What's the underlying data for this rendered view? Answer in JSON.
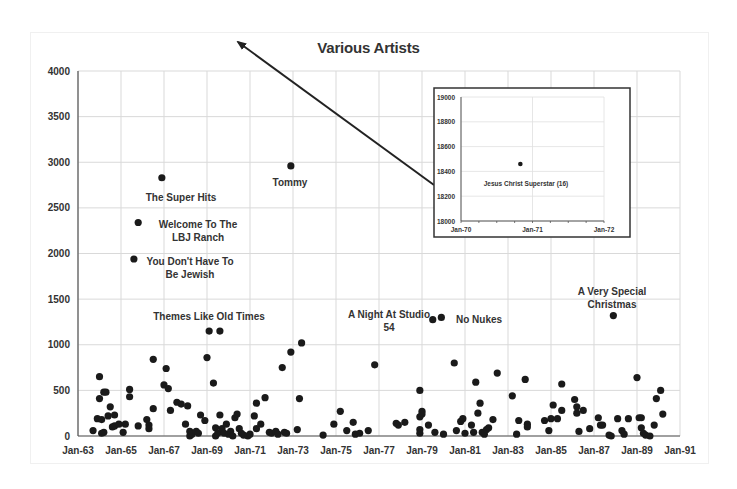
{
  "chart_data": {
    "type": "scatter",
    "title": "Various Artists",
    "xlabel": "",
    "ylabel": "",
    "ylim": [
      0,
      4000
    ],
    "yticks": [
      "0",
      "500",
      "1000",
      "1500",
      "2000",
      "2500",
      "3000",
      "3500",
      "4000"
    ],
    "xticks": [
      "Jan-63",
      "Jan-65",
      "Jan-67",
      "Jan-69",
      "Jan-71",
      "Jan-73",
      "Jan-75",
      "Jan-77",
      "Jan-79",
      "Jan-81",
      "Jan-83",
      "Jan-85",
      "Jan-87",
      "Jan-89",
      "Jan-91"
    ],
    "xlim_years": [
      1963,
      1991
    ],
    "grid": true,
    "legend": null,
    "annotations": [
      {
        "text": "The Super Hits",
        "lines": [
          "The Super Hits"
        ],
        "point": [
          1966.9,
          2830
        ]
      },
      {
        "text": "Welcome To The LBJ Ranch",
        "lines": [
          "Welcome To The",
          "LBJ Ranch"
        ],
        "point": [
          1965.8,
          2340
        ]
      },
      {
        "text": "You Don't Have To Be Jewish",
        "lines": [
          "You Don't Have To",
          "Be Jewish"
        ],
        "point": [
          1965.6,
          1940
        ]
      },
      {
        "text": "Tommy",
        "lines": [
          "Tommy"
        ],
        "point": [
          1972.9,
          2960
        ]
      },
      {
        "text": "Themes Like Old Times",
        "lines": [
          "Themes Like Old Times"
        ],
        "point": [
          1969.1,
          1150
        ]
      },
      {
        "text": "A Night At Studio 54",
        "lines": [
          "A Night At Studio",
          "54"
        ],
        "point": [
          1979.5,
          1275
        ]
      },
      {
        "text": "No Nukes",
        "lines": [
          "No Nukes"
        ],
        "point": [
          1979.9,
          1300
        ]
      },
      {
        "text": "A Very Special Christmas",
        "lines": [
          "A Very Special",
          "Christmas"
        ],
        "point": [
          1987.9,
          1320
        ]
      }
    ],
    "inset": {
      "ylim": [
        18000,
        19000
      ],
      "yticks": [
        "18000",
        "18200",
        "18400",
        "18600",
        "18800",
        "19000"
      ],
      "xticks": [
        "Jan-70",
        "Jan-71",
        "Jan-72"
      ],
      "points": [
        {
          "x": 1970.83,
          "y": 18460,
          "label": "Jesus Christ Superstar (16)"
        }
      ]
    },
    "points": [
      [
        1963.7,
        60
      ],
      [
        1963.9,
        190
      ],
      [
        1964.0,
        650
      ],
      [
        1964.0,
        410
      ],
      [
        1964.1,
        180
      ],
      [
        1964.1,
        30
      ],
      [
        1964.2,
        480
      ],
      [
        1964.3,
        480
      ],
      [
        1964.2,
        40
      ],
      [
        1964.4,
        220
      ],
      [
        1964.5,
        320
      ],
      [
        1964.6,
        100
      ],
      [
        1964.7,
        230
      ],
      [
        1964.7,
        110
      ],
      [
        1964.9,
        130
      ],
      [
        1965.1,
        40
      ],
      [
        1965.2,
        130
      ],
      [
        1965.4,
        510
      ],
      [
        1965.4,
        430
      ],
      [
        1965.8,
        110
      ],
      [
        1966.2,
        180
      ],
      [
        1966.3,
        120
      ],
      [
        1966.3,
        80
      ],
      [
        1966.5,
        300
      ],
      [
        1966.5,
        840
      ],
      [
        1967.0,
        560
      ],
      [
        1967.1,
        740
      ],
      [
        1967.2,
        520
      ],
      [
        1967.3,
        280
      ],
      [
        1967.6,
        370
      ],
      [
        1967.8,
        350
      ],
      [
        1968.0,
        130
      ],
      [
        1968.1,
        330
      ],
      [
        1968.2,
        50
      ],
      [
        1968.2,
        0
      ],
      [
        1968.3,
        20
      ],
      [
        1968.5,
        50
      ],
      [
        1968.6,
        30
      ],
      [
        1968.7,
        230
      ],
      [
        1968.9,
        170
      ],
      [
        1969.0,
        860
      ],
      [
        1969.3,
        580
      ],
      [
        1969.4,
        90
      ],
      [
        1969.4,
        0
      ],
      [
        1969.5,
        30
      ],
      [
        1969.6,
        1150
      ],
      [
        1969.6,
        230
      ],
      [
        1969.7,
        80
      ],
      [
        1969.8,
        30
      ],
      [
        1969.9,
        130
      ],
      [
        1970.0,
        20
      ],
      [
        1970.1,
        50
      ],
      [
        1970.2,
        0
      ],
      [
        1970.3,
        200
      ],
      [
        1970.4,
        240
      ],
      [
        1970.5,
        80
      ],
      [
        1970.6,
        30
      ],
      [
        1970.7,
        10
      ],
      [
        1970.9,
        0
      ],
      [
        1971.0,
        20
      ],
      [
        1971.2,
        220
      ],
      [
        1971.3,
        360
      ],
      [
        1971.3,
        80
      ],
      [
        1971.5,
        130
      ],
      [
        1971.7,
        420
      ],
      [
        1971.9,
        40
      ],
      [
        1972.0,
        30
      ],
      [
        1972.2,
        50
      ],
      [
        1972.3,
        20
      ],
      [
        1972.5,
        750
      ],
      [
        1972.6,
        40
      ],
      [
        1972.7,
        30
      ],
      [
        1972.9,
        920
      ],
      [
        1973.2,
        70
      ],
      [
        1973.3,
        410
      ],
      [
        1973.4,
        1020
      ],
      [
        1974.4,
        10
      ],
      [
        1974.9,
        130
      ],
      [
        1975.2,
        270
      ],
      [
        1975.5,
        60
      ],
      [
        1975.8,
        150
      ],
      [
        1975.9,
        20
      ],
      [
        1976.1,
        30
      ],
      [
        1976.5,
        60
      ],
      [
        1976.8,
        780
      ],
      [
        1977.8,
        140
      ],
      [
        1977.9,
        120
      ],
      [
        1978.2,
        150
      ],
      [
        1978.9,
        210
      ],
      [
        1978.9,
        70
      ],
      [
        1978.9,
        30
      ],
      [
        1978.9,
        500
      ],
      [
        1979.0,
        270
      ],
      [
        1979.0,
        240
      ],
      [
        1979.3,
        120
      ],
      [
        1979.6,
        40
      ],
      [
        1980.0,
        20
      ],
      [
        1980.5,
        800
      ],
      [
        1980.6,
        60
      ],
      [
        1980.8,
        160
      ],
      [
        1980.9,
        190
      ],
      [
        1981.0,
        30
      ],
      [
        1981.3,
        120
      ],
      [
        1981.4,
        40
      ],
      [
        1981.5,
        590
      ],
      [
        1981.6,
        250
      ],
      [
        1981.7,
        360
      ],
      [
        1981.8,
        40
      ],
      [
        1981.9,
        20
      ],
      [
        1982.0,
        70
      ],
      [
        1982.1,
        90
      ],
      [
        1982.3,
        180
      ],
      [
        1982.5,
        690
      ],
      [
        1983.2,
        440
      ],
      [
        1983.4,
        20
      ],
      [
        1983.5,
        170
      ],
      [
        1983.8,
        620
      ],
      [
        1983.9,
        130
      ],
      [
        1983.9,
        100
      ],
      [
        1984.7,
        170
      ],
      [
        1984.9,
        60
      ],
      [
        1985.0,
        190
      ],
      [
        1985.1,
        340
      ],
      [
        1985.3,
        190
      ],
      [
        1985.5,
        570
      ],
      [
        1985.5,
        280
      ],
      [
        1986.1,
        400
      ],
      [
        1986.2,
        320
      ],
      [
        1986.2,
        250
      ],
      [
        1986.3,
        50
      ],
      [
        1986.5,
        280
      ],
      [
        1986.8,
        80
      ],
      [
        1987.2,
        200
      ],
      [
        1987.3,
        120
      ],
      [
        1987.4,
        120
      ],
      [
        1987.7,
        10
      ],
      [
        1987.8,
        0
      ],
      [
        1988.1,
        190
      ],
      [
        1988.3,
        60
      ],
      [
        1988.4,
        20
      ],
      [
        1988.6,
        190
      ],
      [
        1989.0,
        640
      ],
      [
        1989.1,
        200
      ],
      [
        1989.2,
        200
      ],
      [
        1989.2,
        90
      ],
      [
        1989.3,
        30
      ],
      [
        1989.4,
        10
      ],
      [
        1989.6,
        0
      ],
      [
        1989.8,
        120
      ],
      [
        1989.9,
        410
      ],
      [
        1990.1,
        500
      ],
      [
        1990.2,
        240
      ]
    ]
  },
  "arrow": {
    "from": [
      434,
      185
    ],
    "to": [
      238,
      42
    ],
    "color": "#222222"
  }
}
